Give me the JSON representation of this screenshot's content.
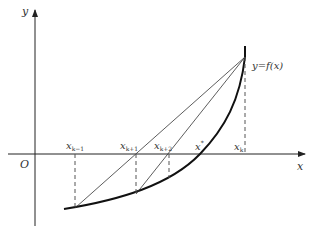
{
  "axes": {
    "x_label": "x",
    "y_label": "y",
    "origin_label": "O"
  },
  "curve_label": "y=f(x)",
  "points": [
    {
      "id": "x_km1",
      "base": "x",
      "sub": "k−1"
    },
    {
      "id": "x_kp1",
      "base": "x",
      "sub": "k+1"
    },
    {
      "id": "x_kp2",
      "base": "x",
      "sub": "k+2"
    },
    {
      "id": "x_star",
      "base": "x",
      "sup": "*"
    },
    {
      "id": "x_k",
      "base": "x",
      "sub": "k"
    }
  ],
  "colors": {
    "stroke": "#222222",
    "dashed": "#555555",
    "text": "#333333"
  }
}
